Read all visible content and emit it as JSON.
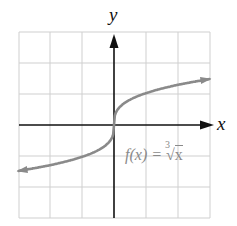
{
  "chart_data": {
    "type": "line",
    "title": "",
    "xlabel": "x",
    "ylabel": "y",
    "function_label": "f(x) = ∛x",
    "xlim": [
      -3,
      3
    ],
    "ylim": [
      -3,
      3
    ],
    "grid": true,
    "grid_step": 1,
    "series": [
      {
        "name": "f(x) = cube root of x",
        "color": "#8a8a8a",
        "x": [
          -3,
          -2,
          -1,
          -0.5,
          -0.1,
          0,
          0.1,
          0.5,
          1,
          2,
          3
        ],
        "y": [
          -1.44,
          -1.26,
          -1,
          -0.79,
          -0.46,
          0,
          0.46,
          0.79,
          1,
          1.26,
          1.44
        ]
      }
    ],
    "arrows_on_curve_ends": true
  },
  "labels": {
    "y_axis": "y",
    "x_axis": "x",
    "func_prefix": "f(x) = ",
    "func_index": "3",
    "func_radicand": "x"
  }
}
